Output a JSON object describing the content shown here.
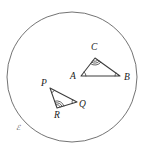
{
  "figure": {
    "background_color": "#ffffff",
    "stroke_color": "#3c3c3c",
    "circle_stroke_color": "#5a5a5a",
    "width": 146,
    "height": 154
  },
  "circle": {
    "name": "plane-boundary-circle",
    "center_x": 72,
    "center_y": 77,
    "radius": 65
  },
  "plane_label": {
    "text": "ℰ",
    "x": 16,
    "y": 130
  },
  "triangles": [
    {
      "id": "triangle-abc",
      "vertices": [
        {
          "label": "A",
          "x": 81,
          "y": 76,
          "label_x": 70,
          "label_y": 79,
          "arcs": 1
        },
        {
          "label": "B",
          "x": 120,
          "y": 76,
          "label_x": 124,
          "label_y": 80,
          "arcs": 1
        },
        {
          "label": "C",
          "x": 95,
          "y": 58,
          "label_x": 91,
          "label_y": 50,
          "arcs": 3
        }
      ]
    },
    {
      "id": "triangle-pqr",
      "vertices": [
        {
          "label": "P",
          "x": 50,
          "y": 88,
          "label_x": 41,
          "label_y": 86,
          "arcs": 1
        },
        {
          "label": "Q",
          "x": 77,
          "y": 102,
          "label_x": 79,
          "label_y": 107,
          "arcs": 1
        },
        {
          "label": "R",
          "x": 57,
          "y": 108,
          "label_x": 54,
          "label_y": 118,
          "arcs": 3
        }
      ]
    }
  ],
  "angle_marks": {
    "single_arc_count": 1,
    "triple_arc_count": 3,
    "description": "Angles A, B, P, Q carry a single arc; angles C and R carry three arcs."
  }
}
